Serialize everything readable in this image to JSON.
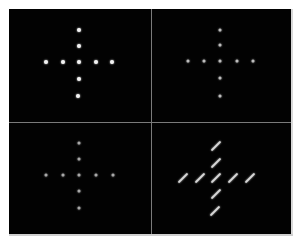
{
  "figure": {
    "background": "#ffffff",
    "panel_color": "#020202",
    "grid_line_color": "#7a7a7a",
    "panels": [
      {
        "id": "top-left",
        "style": "dot",
        "color": "#f2f2f2",
        "size": 4,
        "points": [
          [
            79,
            30
          ],
          [
            79,
            46
          ],
          [
            46,
            62
          ],
          [
            63,
            62
          ],
          [
            79,
            62
          ],
          [
            96,
            62
          ],
          [
            112,
            62
          ],
          [
            79,
            79
          ],
          [
            78,
            96
          ]
        ]
      },
      {
        "id": "top-right",
        "style": "dot",
        "color": "#bdbdbd",
        "size": 3,
        "points": [
          [
            220,
            30
          ],
          [
            220,
            45
          ],
          [
            188,
            61
          ],
          [
            204,
            61
          ],
          [
            220,
            61
          ],
          [
            237,
            61
          ],
          [
            253,
            61
          ],
          [
            220,
            78
          ],
          [
            220,
            96
          ]
        ]
      },
      {
        "id": "bottom-left",
        "style": "dot",
        "color": "#a8a8a8",
        "size": 3,
        "points": [
          [
            79,
            143
          ],
          [
            79,
            159
          ],
          [
            46,
            175
          ],
          [
            63,
            175
          ],
          [
            79,
            175
          ],
          [
            96,
            175
          ],
          [
            113,
            175
          ],
          [
            79,
            191
          ],
          [
            79,
            208
          ]
        ]
      },
      {
        "id": "bottom-right",
        "style": "streak",
        "color": "#d6d6d6",
        "length": 13,
        "points": [
          [
            216,
            146
          ],
          [
            216,
            163
          ],
          [
            183,
            178
          ],
          [
            200,
            178
          ],
          [
            216,
            178
          ],
          [
            233,
            178
          ],
          [
            250,
            178
          ],
          [
            216,
            194
          ],
          [
            215,
            211
          ]
        ]
      }
    ]
  }
}
